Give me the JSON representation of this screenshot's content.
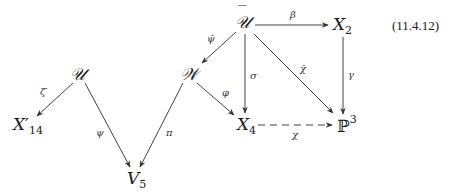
{
  "equation_number": "(11.4.12)",
  "nodes": {
    "U_bar": {
      "base": "𝒰",
      "accent": "‾"
    },
    "X2": {
      "base": "X",
      "sub": "2"
    },
    "U": {
      "base": "𝒰"
    },
    "W": {
      "base": "𝒲"
    },
    "X14p": {
      "base": "X",
      "prime": "′",
      "sub": "14"
    },
    "X4": {
      "base": "X",
      "sub": "4"
    },
    "P3": {
      "base": "ℙ",
      "sup": "3"
    },
    "V5": {
      "base": "V",
      "sub": "5"
    }
  },
  "arrows": {
    "beta": "β",
    "psi_bar": "ψ̄",
    "sigma": "σ",
    "chi_bar": "χ̄",
    "gamma": "γ",
    "zeta_prime": "ζ′",
    "varphi": "φ",
    "psi": "ψ",
    "pi": "π",
    "chi": "χ"
  }
}
